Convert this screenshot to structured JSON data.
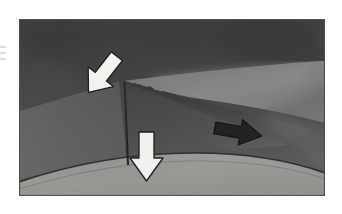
{
  "document": {
    "type": "scanned-grayscale-illustration",
    "title": "",
    "caption": "",
    "background_color": "#ffffff"
  },
  "figure": {
    "name": "curved-surface-diagram",
    "frame": {
      "x": 19,
      "y": 19,
      "width": 306,
      "height": 177,
      "border_color": "#5a5a5a"
    },
    "palette": {
      "dark_background": "#5c5c5c",
      "mid_gray": "#8a8a8a",
      "light_band": "#d9d7d2",
      "bright_highlight": "#e8e6e1",
      "shadow_wedge": "#4a4a4a",
      "deep_shadow": "#3a3a3a",
      "lower_surface": "#c9c7c2",
      "outline": "#2e2e2e",
      "arrow_fill_white": "#f2f1ed",
      "arrow_fill_dark": "#262626",
      "arrow_stroke": "#1f1f1f"
    },
    "regions": [
      {
        "name": "upper-dark-surface",
        "label": "",
        "tone": "dark"
      },
      {
        "name": "bright-crescent-band",
        "label": "",
        "tone": "light"
      },
      {
        "name": "mid-gray-slope",
        "label": "",
        "tone": "mid"
      },
      {
        "name": "shadow-wedge",
        "label": "",
        "tone": "very-dark"
      },
      {
        "name": "lower-curved-surface",
        "label": "",
        "tone": "light"
      }
    ],
    "markers": [
      {
        "name": "apex-vertex",
        "x": 105,
        "y": 62
      },
      {
        "name": "vertical-rule",
        "x1": 105,
        "y1": 62,
        "x2": 109,
        "y2": 146
      }
    ],
    "arrows": [
      {
        "name": "white-arrow-apex",
        "style": "outlined-white",
        "direction": "down-right",
        "rotation_deg": 38,
        "x": 104,
        "y": 50,
        "label": ""
      },
      {
        "name": "dark-arrow-shadow",
        "style": "solid-dark",
        "direction": "right",
        "rotation_deg": 10,
        "x": 243,
        "y": 118,
        "label": ""
      },
      {
        "name": "white-arrow-lower",
        "style": "outlined-white",
        "direction": "down",
        "rotation_deg": 0,
        "x": 142,
        "y": 150,
        "label": ""
      }
    ]
  }
}
